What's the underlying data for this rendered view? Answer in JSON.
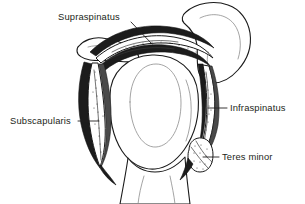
{
  "figure": {
    "view": "coronal section through the glenohumeral joint",
    "background_color": "#ffffff",
    "ink_color": "#231f20",
    "label_color": "#231f20",
    "style": "black and white line drawing with stipple shading"
  },
  "labels": [
    {
      "id": "supraspinatus",
      "text": "Supraspinatus",
      "text_x": 58,
      "text_y": 20,
      "anchor": "start",
      "leader_path": "M 131 22 L 152 44",
      "target": "tendon arching over the humeral head beneath the acromion"
    },
    {
      "id": "subscapularis",
      "text": "Subscapularis",
      "text_x": 10,
      "text_y": 124,
      "anchor": "start",
      "leader_path": "M 78 121 L 99 121",
      "target": "muscle band on the anterior (left) aspect of the joint"
    },
    {
      "id": "infraspinatus",
      "text": "Infraspinatus",
      "text_x": 230,
      "text_y": 111,
      "anchor": "start",
      "leader_path": "M 208 108 L 227 108",
      "target": "muscle band on the posterior (right) aspect of the joint"
    },
    {
      "id": "teres-minor",
      "text": "Teres minor",
      "text_x": 222,
      "text_y": 160,
      "anchor": "start",
      "leader_path": "M 203 157 L 219 157",
      "target": "small rounded muscle belly below the infraspinatus"
    }
  ],
  "structures": [
    {
      "id": "acromion-left",
      "name": "acromion process (left tip)"
    },
    {
      "id": "scapular-spine",
      "name": "scapular spine / acromion mass (upper right)"
    },
    {
      "id": "humeral-head",
      "name": "humeral head"
    },
    {
      "id": "humeral-shaft",
      "name": "humeral shaft"
    },
    {
      "id": "glenoid-cavity",
      "name": "glenoid fossa outline"
    },
    {
      "id": "supraspinatus-tendon",
      "name": "supraspinatus tendon"
    },
    {
      "id": "subscapularis-muscle",
      "name": "subscapularis muscle"
    },
    {
      "id": "infraspinatus-muscle",
      "name": "infraspinatus muscle"
    },
    {
      "id": "teres-minor-muscle",
      "name": "teres minor muscle"
    }
  ]
}
